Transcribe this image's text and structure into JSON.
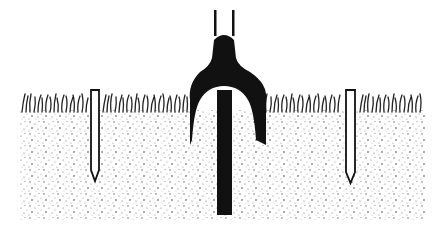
{
  "figure": {
    "colors": {
      "background": "#ffffff",
      "ink": "#111111",
      "soil_stipple": "#555555"
    },
    "elements": [
      {
        "name": "ground-soil",
        "label": "stippled soil"
      },
      {
        "name": "grass-line",
        "label": "grass"
      },
      {
        "name": "left-stake",
        "label": "stake"
      },
      {
        "name": "right-stake",
        "label": "stake"
      },
      {
        "name": "fork-tool",
        "label": "forked driver"
      },
      {
        "name": "central-rod",
        "label": "rod"
      }
    ]
  }
}
